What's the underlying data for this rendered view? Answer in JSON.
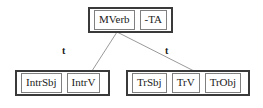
{
  "diagram": {
    "type": "linguistic-tree",
    "colors": {
      "group_border": "#3a3a3a",
      "node_border": "#808080",
      "edge_line": "#9a9a9a",
      "text": "#1a1a1a",
      "background": "#ffffff"
    },
    "top_group": {
      "name": "main-verb-group",
      "nodes": [
        {
          "label": "MVerb"
        },
        {
          "label": "-TA"
        }
      ]
    },
    "edges": [
      {
        "name": "edge-to-intransitive",
        "label": "t",
        "from": "MVerb",
        "to": "IntrV"
      },
      {
        "name": "edge-to-transitive",
        "label": "t",
        "from": "MVerb",
        "to": "TrV"
      }
    ],
    "bottom_groups": [
      {
        "name": "intransitive-frame",
        "nodes": [
          {
            "label": "IntrSbj"
          },
          {
            "label": "IntrV"
          }
        ]
      },
      {
        "name": "transitive-frame",
        "nodes": [
          {
            "label": "TrSbj"
          },
          {
            "label": "TrV"
          },
          {
            "label": "TrObj"
          }
        ]
      }
    ]
  }
}
